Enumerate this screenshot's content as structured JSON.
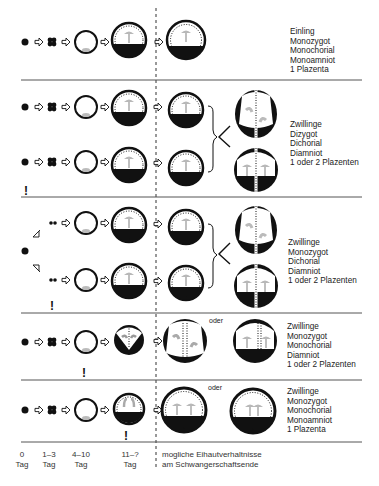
{
  "rows": [
    {
      "id": "row1",
      "lines": [
        "Einling",
        "Monozygot",
        "Monochorial",
        "Monoamniot",
        "1 Plazenta"
      ]
    },
    {
      "id": "row2",
      "lines": [
        "Zwillinge",
        "Dizygot",
        "Dichorial",
        "Diamniot",
        "1 oder 2 Plazenten"
      ]
    },
    {
      "id": "row3",
      "lines": [
        "Zwillinge",
        "Monozygot",
        "Dichorial",
        "Diamniot",
        "1 oder 2 Plazenten"
      ]
    },
    {
      "id": "row4",
      "lines": [
        "Zwillinge",
        "Monozygot",
        "Monochorial",
        "Diamniot",
        "1 oder  2 Plazenten"
      ],
      "connector": "oder"
    },
    {
      "id": "row5",
      "lines": [
        "Zwillinge",
        "Monozygot",
        "Monochorial",
        "Monoamniot",
        "1 Plazenta"
      ],
      "connector": "oder"
    }
  ],
  "timeline": [
    {
      "value": "0",
      "unit": "Tag"
    },
    {
      "value": "1–3",
      "unit": "Tag"
    },
    {
      "value": "4–10",
      "unit": "Tag"
    },
    {
      "value": "11–?",
      "unit": "Tag"
    }
  ],
  "caption": {
    "line1": "mogliche Eihautverhaltnisse",
    "line2": "am Schwangerschaftsende"
  },
  "markers": {
    "warning": "!"
  },
  "colors": {
    "ink": "#111111",
    "embryo": "#b5b5b5",
    "divider": "#555555"
  }
}
